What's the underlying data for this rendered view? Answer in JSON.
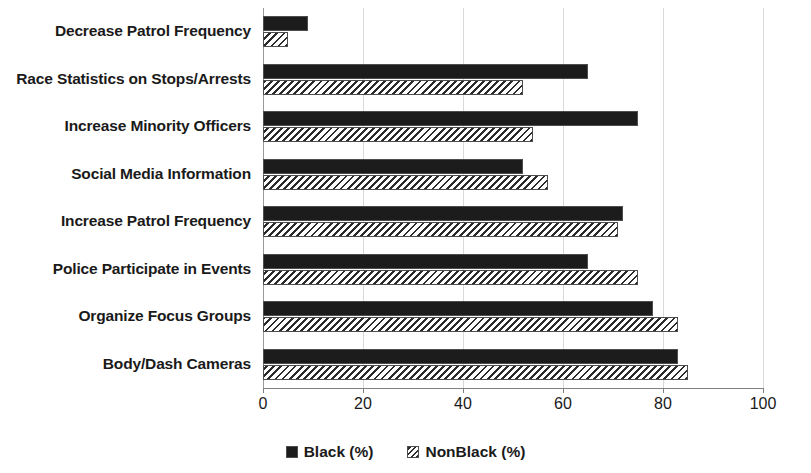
{
  "chart_data": {
    "type": "bar",
    "orientation": "horizontal",
    "title": "",
    "xlabel": "",
    "ylabel": "",
    "xlim": [
      0,
      100
    ],
    "xticks": [
      0,
      20,
      40,
      60,
      80,
      100
    ],
    "grid": true,
    "legend_position": "bottom-center",
    "categories": [
      "Decrease Patrol Frequency",
      "Race Statistics on Stops/Arrests",
      "Increase Minority Officers",
      "Social Media Information",
      "Increase Patrol Frequency",
      "Police Participate in Events",
      "Organize Focus Groups",
      "Body/Dash Cameras"
    ],
    "series": [
      {
        "name": "Black (%)",
        "style": "solid-black",
        "values": [
          9,
          65,
          75,
          52,
          72,
          65,
          78,
          83
        ]
      },
      {
        "name": "NonBlack (%)",
        "style": "diagonal-hatch",
        "values": [
          5,
          52,
          54,
          57,
          71,
          75,
          83,
          85
        ]
      }
    ]
  },
  "legend": {
    "items": [
      {
        "label": "Black (%)",
        "swatch": "solid-black-square-icon"
      },
      {
        "label": "NonBlack (%)",
        "swatch": "hatched-square-icon"
      }
    ]
  },
  "colors": {
    "bar_black": "#1c1c1c",
    "bar_hatch_stroke": "#2b2b2b",
    "bar_outline": "#4d4d4d",
    "gridline": "#d9d9d9",
    "axis": "#808080",
    "text": "#1a1a1a",
    "background": "#ffffff"
  }
}
